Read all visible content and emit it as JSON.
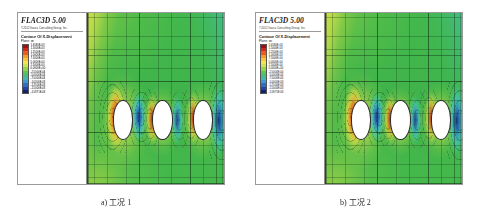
{
  "figure": {
    "software_title": "FLAC3D 5.00",
    "copyright": "©2012 Itasca Consulting Group, Inc.",
    "contour_title": "Contour Of X-Displacement",
    "plane_label": "Plane: on"
  },
  "legend": {
    "ticks": [
      "1.6580E-03",
      "1.5000E-03",
      "1.2500E-03",
      "1.0000E-03",
      "7.5000E-04",
      "5.0000E-04",
      "2.5000E-04",
      "0.0000E+00",
      "-2.5000E-04",
      "-5.0000E-04",
      "-7.5000E-04",
      "-1.0000E-03",
      "-1.2500E-03",
      "-1.5000E-03",
      "-1.5871E-03"
    ],
    "colors": [
      "#9e1014",
      "#d02a1c",
      "#ef5a20",
      "#f79a2c",
      "#f6c63c",
      "#f2e452",
      "#cfe256",
      "#96d44e",
      "#5ec457",
      "#49bc7e",
      "#46b7ad",
      "#3f9bcb",
      "#2f6ec0",
      "#2443a4",
      "#15206e"
    ]
  },
  "panels": [
    {
      "id": "panel-a",
      "caption": "a) 工况 1",
      "tunnel_count": 3,
      "tunnels": [
        {
          "cx_pct": 25,
          "cy_pct": 62,
          "r_pct": 11
        },
        {
          "cx_pct": 54,
          "cy_pct": 62,
          "r_pct": 11
        },
        {
          "cx_pct": 84,
          "cy_pct": 62,
          "r_pct": 11
        }
      ]
    },
    {
      "id": "panel-b",
      "caption": "b) 工况 2",
      "tunnel_count": 3,
      "tunnels": [
        {
          "cx_pct": 25,
          "cy_pct": 62,
          "r_pct": 11
        },
        {
          "cx_pct": 54,
          "cy_pct": 62,
          "r_pct": 11
        },
        {
          "cx_pct": 84,
          "cy_pct": 62,
          "r_pct": 11
        }
      ]
    }
  ],
  "chart_data": {
    "type": "heatmap",
    "title": "Contour Of X-Displacement",
    "subtitle": "FLAC3D 5.00 — two load cases (工况 1 / 工况 2)",
    "xlabel": "",
    "ylabel": "",
    "grid": true,
    "legend_position": "left",
    "colorbar": {
      "label": "X-Displacement (m)",
      "vmin": -0.0015871,
      "vmax": 0.001658,
      "levels": [
        0.001658,
        0.0015,
        0.00125,
        0.001,
        0.00075,
        0.0005,
        0.00025,
        0.0,
        -0.00025,
        -0.0005,
        -0.00075,
        -0.001,
        -0.00125,
        -0.0015,
        -0.0015871
      ],
      "tick_labels": [
        "1.6580E-03",
        "1.5000E-03",
        "1.2500E-03",
        "1.0000E-03",
        "7.5000E-04",
        "5.0000E-04",
        "2.5000E-04",
        "0.0000E+00",
        "-2.5000E-04",
        "-5.0000E-04",
        "-7.5000E-04",
        "-1.0000E-03",
        "-1.2500E-03",
        "-1.5000E-03",
        "-1.5871E-03"
      ],
      "colors": [
        "#9e1014",
        "#d02a1c",
        "#ef5a20",
        "#f79a2c",
        "#f6c63c",
        "#f2e452",
        "#cfe256",
        "#96d44e",
        "#5ec457",
        "#49bc7e",
        "#46b7ad",
        "#3f9bcb",
        "#2f6ec0",
        "#2443a4",
        "#15206e"
      ]
    },
    "panels": [
      {
        "name": "a) 工况 1",
        "features": [
          {
            "feature": "tunnel",
            "index": 1,
            "cx_pct": 25,
            "cy_pct": 62,
            "left_lobe_peak": 0.001658,
            "right_lobe_peak": -0.0011
          },
          {
            "feature": "tunnel",
            "index": 2,
            "cx_pct": 54,
            "cy_pct": 62,
            "left_lobe_peak": 0.00075,
            "right_lobe_peak": -0.0009
          },
          {
            "feature": "tunnel",
            "index": 3,
            "cx_pct": 84,
            "cy_pct": 62,
            "left_lobe_peak": 0.00065,
            "right_lobe_peak": -0.0015
          }
        ],
        "background_field": 0.0
      },
      {
        "name": "b) 工况 2",
        "features": [
          {
            "feature": "tunnel",
            "index": 1,
            "cx_pct": 25,
            "cy_pct": 62,
            "left_lobe_peak": 0.0016,
            "right_lobe_peak": -0.00105
          },
          {
            "feature": "tunnel",
            "index": 2,
            "cx_pct": 54,
            "cy_pct": 62,
            "left_lobe_peak": 0.00072,
            "right_lobe_peak": -0.00095
          },
          {
            "feature": "tunnel",
            "index": 3,
            "cx_pct": 84,
            "cy_pct": 62,
            "left_lobe_peak": 0.0007,
            "right_lobe_peak": -0.001587
          }
        ],
        "background_field": 0.0
      }
    ]
  }
}
